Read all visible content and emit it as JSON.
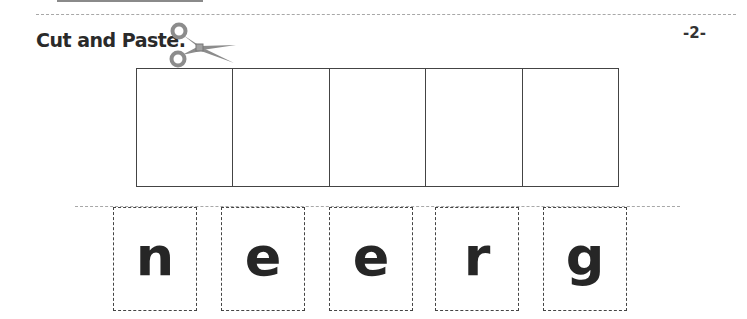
{
  "worksheet": {
    "title": "Cut and Paste.",
    "page_number": "-2-",
    "icon": "scissors-icon",
    "paste_boxes": [
      {
        "index": 1,
        "value": ""
      },
      {
        "index": 2,
        "value": ""
      },
      {
        "index": 3,
        "value": ""
      },
      {
        "index": 4,
        "value": ""
      },
      {
        "index": 5,
        "value": ""
      }
    ],
    "letter_cards": [
      {
        "letter": "n"
      },
      {
        "letter": "e"
      },
      {
        "letter": "e"
      },
      {
        "letter": "r"
      },
      {
        "letter": "g"
      }
    ]
  },
  "colors": {
    "ink": "#262626",
    "scissors": "#8c8c8c",
    "dashed_rule": "#a8a8a8"
  }
}
